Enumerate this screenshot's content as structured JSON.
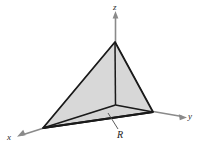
{
  "figure": {
    "kind": "3d-tetrahedron-diagram",
    "width": 199,
    "height": 150,
    "background_color": "#ffffff"
  },
  "axes": {
    "z": {
      "label": "z",
      "icon": "arrow-up-icon",
      "color": "#808080"
    },
    "y": {
      "label": "y",
      "icon": "arrow-right-icon",
      "color": "#808080"
    },
    "x": {
      "label": "x",
      "icon": "arrow-down-left-icon",
      "color": "#808080"
    }
  },
  "annotations": {
    "region": {
      "label": "R",
      "leader_line": true,
      "color": "#1a1a1a"
    }
  },
  "solid": {
    "name": "tetrahedron",
    "outline_color": "#1a1a1a",
    "faces": [
      {
        "name": "front-left-face",
        "fill": "#d6d6d6"
      },
      {
        "name": "front-right-face",
        "fill": "#cfcfcf"
      },
      {
        "name": "base-face",
        "fill": "#bdbdbd"
      }
    ],
    "vertices": {
      "apex_z": {
        "x": 115,
        "y": 42
      },
      "intercept_x": {
        "x": 43,
        "y": 128
      },
      "intercept_y": {
        "x": 153,
        "y": 112
      },
      "origin": {
        "x": 115,
        "y": 105
      }
    }
  }
}
